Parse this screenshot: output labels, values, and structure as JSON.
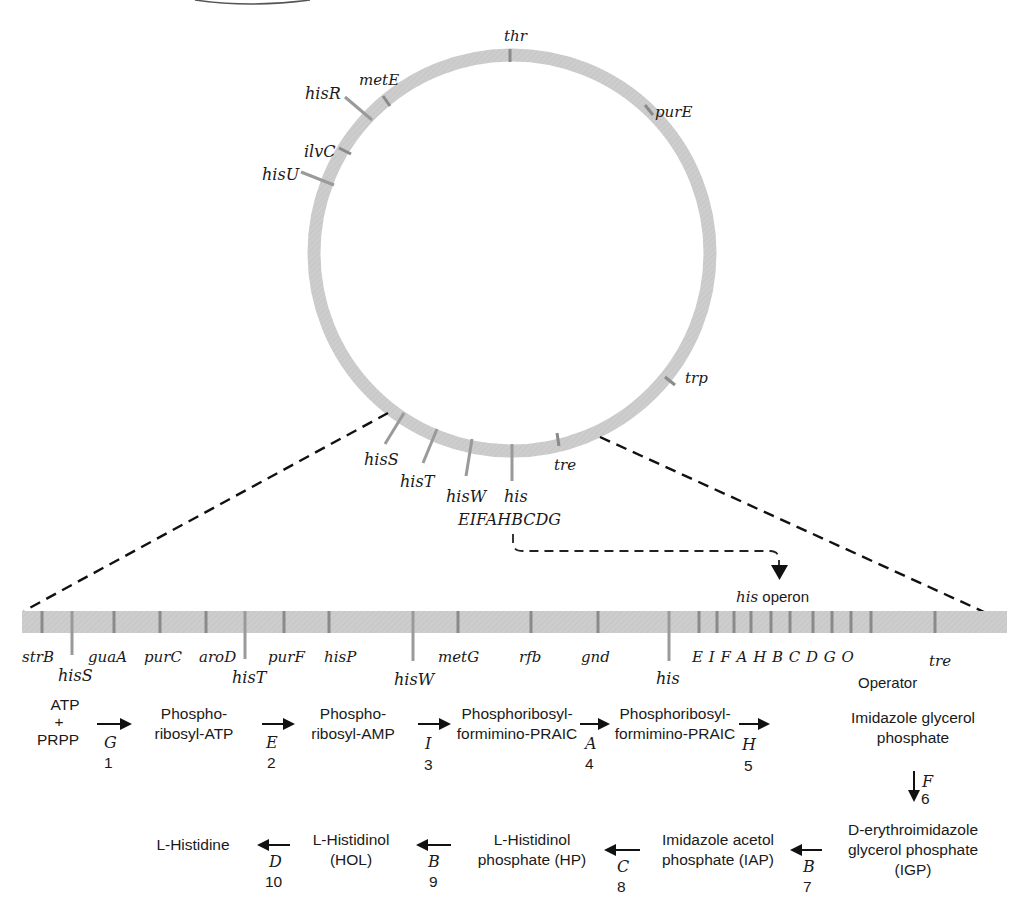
{
  "colors": {
    "chromosome_fill": "#cfcfcf",
    "tick": "#8a8a8a",
    "text": "#1a1a1a",
    "dashed_line": "#111111"
  },
  "circular_map": {
    "center": [
      512,
      253
    ],
    "radius": 198,
    "band_width": 13,
    "genes": [
      {
        "label": "thr",
        "x": 508,
        "y": 39
      },
      {
        "label": "purE",
        "x": 654,
        "y": 114
      },
      {
        "label": "metE",
        "x": 359,
        "y": 84
      },
      {
        "label": "hisR",
        "x": 305,
        "y": 99
      },
      {
        "label": "ilvC",
        "x": 304,
        "y": 155
      },
      {
        "label": "hisU",
        "x": 262,
        "y": 180
      },
      {
        "label": "trp",
        "x": 685,
        "y": 381
      },
      {
        "label": "hisS",
        "x": 364,
        "y": 465
      },
      {
        "label": "hisT",
        "x": 400,
        "y": 487
      },
      {
        "label": "hisW",
        "x": 446,
        "y": 502
      },
      {
        "label": "his",
        "x": 503,
        "y": 502
      },
      {
        "label": "tre",
        "x": 554,
        "y": 470
      }
    ],
    "his_genes_label": "EIFAHBCDG"
  },
  "operon_callout": {
    "italic": "his",
    "plain": " operon"
  },
  "linear_map": {
    "labels_upper": [
      {
        "label": "strB",
        "x": 22
      },
      {
        "label": "guaA",
        "x": 88
      },
      {
        "label": "purC",
        "x": 144
      },
      {
        "label": "aroD",
        "x": 199
      },
      {
        "label": "purF",
        "x": 268
      },
      {
        "label": "hisP",
        "x": 324
      },
      {
        "label": "metG",
        "x": 438
      },
      {
        "label": "rfb",
        "x": 519
      },
      {
        "label": "gnd",
        "x": 581
      },
      {
        "label": "tre",
        "x": 929
      }
    ],
    "labels_lower": [
      {
        "label": "hisS",
        "x": 58
      },
      {
        "label": "hisT",
        "x": 232
      },
      {
        "label": "hisW",
        "x": 394
      },
      {
        "label": "his",
        "x": 656
      }
    ],
    "operon_letters": "E I F A H B C D G O",
    "operator_label": "Operator"
  },
  "pathway": {
    "substrate_top": "ATP",
    "substrate_plus": "+",
    "substrate_bottom": "PRPP",
    "row1": [
      {
        "line1": "Phospho-",
        "line2": "ribosyl-ATP"
      },
      {
        "line1": "Phospho-",
        "line2": "ribosyl-AMP"
      },
      {
        "line1": "Phosphoribosyl-",
        "line2": "formimino-PRAIC"
      },
      {
        "line1": "Phosphoribosyl-",
        "line2": "formimino-PRAIC"
      },
      {
        "line1": "Imidazole glycerol",
        "line2": "phosphate"
      }
    ],
    "row1_steps": [
      {
        "enzyme": "G",
        "step": "1"
      },
      {
        "enzyme": "E",
        "step": "2"
      },
      {
        "enzyme": "I",
        "step": "3"
      },
      {
        "enzyme": "A",
        "step": "4"
      },
      {
        "enzyme": "H",
        "step": "5"
      }
    ],
    "down_step": {
      "enzyme": "F",
      "step": "6"
    },
    "row2": [
      {
        "line1": "D-erythroimidazole",
        "line2": "glycerol phosphate",
        "line3": "(IGP)"
      },
      {
        "line1": "Imidazole acetol",
        "line2": "phosphate (IAP)"
      },
      {
        "line1": "L-Histidinol",
        "line2": "phosphate (HP)"
      },
      {
        "line1": "L-Histidinol",
        "line2": "(HOL)"
      },
      {
        "line1": "L-Histidine"
      }
    ],
    "row2_steps": [
      {
        "enzyme": "B",
        "step": "7"
      },
      {
        "enzyme": "C",
        "step": "8"
      },
      {
        "enzyme": "B",
        "step": "9"
      },
      {
        "enzyme": "D",
        "step": "10"
      }
    ]
  }
}
